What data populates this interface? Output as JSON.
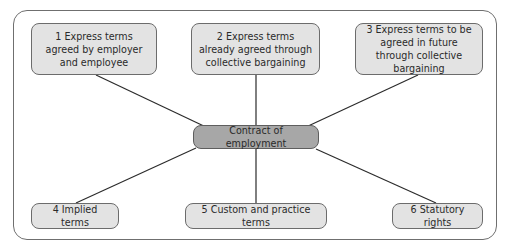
{
  "diagram": {
    "center": {
      "label": "Contract of employment",
      "fill": "#a7a7a7"
    },
    "nodes": [
      {
        "label": "1 Express terms agreed by employer and employee"
      },
      {
        "label": "2 Express terms already agreed through collective bargaining"
      },
      {
        "label": "3 Express terms to be agreed in future through collective bargaining"
      },
      {
        "label": "4 Implied terms"
      },
      {
        "label": "5 Custom and practice terms"
      },
      {
        "label": "6 Statutory rights"
      }
    ],
    "node_fill": "#e3e3e3",
    "line_color": "#2b2b2b"
  }
}
